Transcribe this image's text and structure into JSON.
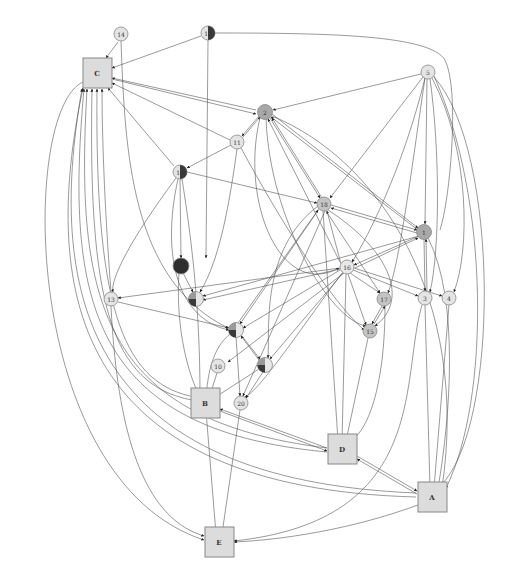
{
  "diagram": {
    "type": "directed-graph",
    "colors": {
      "node_fill_light": "#e4e4e4",
      "node_fill_mid": "#b0b0b0",
      "node_fill_dark": "#3a3a3a",
      "box_fill": "#dcdcdc",
      "edge": "#555555",
      "border": "#888888"
    },
    "boxes": [
      {
        "id": "C",
        "label": "C",
        "x": 97,
        "y": 73
      },
      {
        "id": "B",
        "label": "B",
        "x": 205,
        "y": 403
      },
      {
        "id": "D",
        "label": "D",
        "x": 342,
        "y": 449
      },
      {
        "id": "A",
        "label": "A",
        "x": 432,
        "y": 497
      },
      {
        "id": "E",
        "label": "E",
        "x": 219,
        "y": 542
      }
    ],
    "circles": [
      {
        "id": "14",
        "label": "14",
        "x": 121,
        "y": 34,
        "style": "light"
      },
      {
        "id": "12",
        "label": "12",
        "x": 208,
        "y": 33,
        "style": "half"
      },
      {
        "id": "5",
        "label": "5",
        "x": 428,
        "y": 72,
        "style": "light"
      },
      {
        "id": "2",
        "label": "2",
        "x": 265,
        "y": 112,
        "style": "mid"
      },
      {
        "id": "11",
        "label": "11",
        "x": 237,
        "y": 142,
        "style": "light"
      },
      {
        "id": "19",
        "label": "19",
        "x": 180,
        "y": 172,
        "style": "half"
      },
      {
        "id": "18",
        "label": "18",
        "x": 324,
        "y": 204,
        "style": "light-mid"
      },
      {
        "id": "1",
        "label": "1",
        "x": 424,
        "y": 232,
        "style": "mid"
      },
      {
        "id": "16",
        "label": "16",
        "x": 347,
        "y": 267,
        "style": "light"
      },
      {
        "id": "7",
        "label": "7",
        "x": 181,
        "y": 266,
        "style": "dark"
      },
      {
        "id": "13",
        "label": "13",
        "x": 111,
        "y": 299,
        "style": "light"
      },
      {
        "id": "8",
        "label": "8",
        "x": 196,
        "y": 299,
        "style": "pie"
      },
      {
        "id": "17",
        "label": "17",
        "x": 384,
        "y": 299,
        "style": "light-mid"
      },
      {
        "id": "3",
        "label": "3",
        "x": 425,
        "y": 298,
        "style": "light"
      },
      {
        "id": "4",
        "label": "4",
        "x": 449,
        "y": 298,
        "style": "light"
      },
      {
        "id": "9",
        "label": "9",
        "x": 236,
        "y": 330,
        "style": "pie"
      },
      {
        "id": "15",
        "label": "15",
        "x": 370,
        "y": 331,
        "style": "light-mid"
      },
      {
        "id": "10",
        "label": "10",
        "x": 218,
        "y": 366,
        "style": "light"
      },
      {
        "id": "6",
        "label": "6",
        "x": 265,
        "y": 365,
        "style": "pie"
      },
      {
        "id": "20",
        "label": "20",
        "x": 241,
        "y": 403,
        "style": "light"
      }
    ]
  }
}
